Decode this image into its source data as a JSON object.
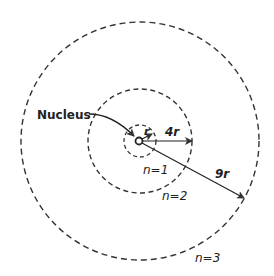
{
  "diagram": {
    "center": {
      "x": 139,
      "y": 141
    },
    "nucleus_label": "Nucleus",
    "orbits": [
      {
        "label": "n=1",
        "radius_label": "r",
        "radius_px": 16
      },
      {
        "label": "n=2",
        "radius_label": "4r",
        "radius_px": 52
      },
      {
        "label": "n=3",
        "radius_label": "9r",
        "radius_px": 119
      }
    ],
    "colors": {
      "stroke": "#333333",
      "background": "#ffffff"
    }
  }
}
